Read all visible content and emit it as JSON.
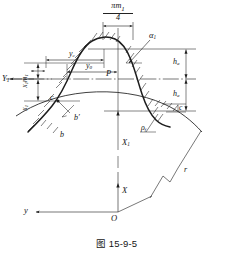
{
  "figure": {
    "caption": "图 15-9-5",
    "kind": "engineering-line-drawing"
  },
  "labels": {
    "pitch_width_num": "πm",
    "pitch_width_num_sub": "1",
    "pitch_width_den": "4",
    "pressure_angle": "α",
    "pressure_angle_sub": "1",
    "pitch_point": "P",
    "y_c": "y",
    "y_c_sub": "c",
    "y_0": "y",
    "y_0_sub": "0",
    "addendum": "h",
    "addendum_sub": "a",
    "dedendum": "h",
    "dedendum_sub": "a",
    "axis_Y1": "Y",
    "axis_Y1_sub": "1",
    "shift_xm": "x",
    "shift_xm_sub1": "1",
    "shift_xm_m": "m",
    "shift_xm_sub2": "1",
    "shift_x": "x",
    "shift_x_sub": "1",
    "point_c": "c",
    "point_b_prime": "b′",
    "point_b": "b",
    "fillet_radius": "ρ",
    "fillet_radius_sub": "f",
    "radius_r": "r",
    "small_c": "c",
    "axis_X1": "X",
    "axis_X1_sub": "1",
    "axis_X": "X",
    "axis_y": "y",
    "origin_O": "O"
  },
  "colors": {
    "line": "#1d1d1d",
    "thin_line": "#4a4a4a",
    "background": "#ffffff",
    "text": "#141414"
  }
}
